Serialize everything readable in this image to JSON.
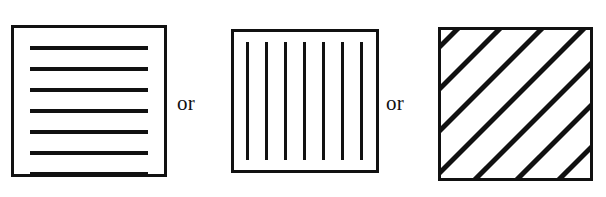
{
  "figure": {
    "name": "texture-orientation-choices",
    "background_color": "#ffffff",
    "line_color": "#111111",
    "border_color": "#111111"
  },
  "panels": [
    {
      "id": "panel-horizontal",
      "name": "horizontal-stripes-panel",
      "pattern": "horizontal-lines",
      "orientation_degrees": 0,
      "line_count": 7,
      "line_thickness_px": 4,
      "border_width_px": 3,
      "bounds": {
        "x": 11,
        "y": 25,
        "width": 156,
        "height": 152
      },
      "line_positions_y": [
        18,
        39,
        60,
        81,
        102,
        123,
        144
      ]
    },
    {
      "id": "panel-vertical",
      "name": "vertical-stripes-panel",
      "pattern": "vertical-lines",
      "orientation_degrees": 90,
      "line_count": 7,
      "line_thickness_px": 3,
      "border_width_px": 3,
      "bounds": {
        "x": 231,
        "y": 29,
        "width": 148,
        "height": 144
      },
      "line_positions_x": [
        12,
        31,
        50,
        69,
        88,
        107,
        126
      ]
    },
    {
      "id": "panel-diagonal",
      "name": "diagonal-stripes-panel",
      "pattern": "diagonal-lines",
      "orientation_degrees": 45,
      "line_count": 8,
      "line_thickness_px": 5,
      "border_width_px": 3,
      "bounds": {
        "x": 438,
        "y": 27,
        "width": 155,
        "height": 154
      },
      "line_offsets": [
        -42,
        0,
        42,
        84,
        126,
        168,
        210,
        252
      ]
    }
  ],
  "connectors": [
    {
      "id": "or-1",
      "name": "connector-or-first",
      "label": "or",
      "x": 177,
      "y": 93
    },
    {
      "id": "or-2",
      "name": "connector-or-second",
      "label": "or",
      "x": 386,
      "y": 93
    }
  ]
}
